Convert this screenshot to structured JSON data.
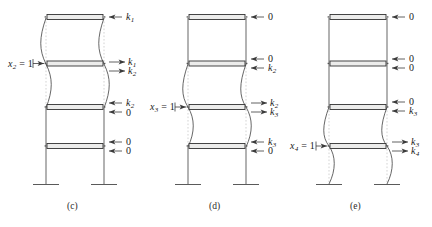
{
  "figure": {
    "title": "",
    "background": "#ffffff",
    "ink": "#3a3a3a",
    "beam_fill": "#e8e8e6",
    "dash_color": "#b9b9b9"
  },
  "panels": [
    {
      "id": "c",
      "caption": "(c)",
      "dof_label": "x",
      "dof_sub": "2",
      "dof_eq": " = 1",
      "dof_text": "x2 = 1",
      "deflected_between_floors": [
        1,
        3
      ],
      "floors": [
        {
          "index": 1,
          "labels": [
            "k1"
          ]
        },
        {
          "index": 2,
          "labels": [
            "k1",
            "k2"
          ]
        },
        {
          "index": 3,
          "labels": [
            "k2",
            "0"
          ]
        },
        {
          "index": 4,
          "labels": [
            "0",
            "0"
          ]
        }
      ],
      "force_labels": [
        {
          "base": "k",
          "sub": "1",
          "dir": "left",
          "floor": 1,
          "slot": 0
        },
        {
          "base": "k",
          "sub": "1",
          "dir": "right",
          "floor": 2,
          "slot": 0
        },
        {
          "base": "k",
          "sub": "2",
          "dir": "right",
          "floor": 2,
          "slot": 1
        },
        {
          "base": "k",
          "sub": "2",
          "dir": "left",
          "floor": 3,
          "slot": 0
        },
        {
          "base": "0",
          "sub": "",
          "dir": "left",
          "floor": 3,
          "slot": 1
        },
        {
          "base": "0",
          "sub": "",
          "dir": "left",
          "floor": 4,
          "slot": 0
        },
        {
          "base": "0",
          "sub": "",
          "dir": "left",
          "floor": 4,
          "slot": 1
        }
      ]
    },
    {
      "id": "d",
      "caption": "(d)",
      "dof_label": "x",
      "dof_sub": "3",
      "dof_eq": " = 1",
      "dof_text": "x3 = 1",
      "deflected_between_floors": [
        2,
        4
      ],
      "floors": [
        {
          "index": 1,
          "labels": [
            "0"
          ]
        },
        {
          "index": 2,
          "labels": [
            "0",
            "k2"
          ]
        },
        {
          "index": 3,
          "labels": [
            "k2",
            "k3"
          ]
        },
        {
          "index": 4,
          "labels": [
            "k3",
            "0"
          ]
        }
      ],
      "force_labels": [
        {
          "base": "0",
          "sub": "",
          "dir": "left",
          "floor": 1,
          "slot": 0
        },
        {
          "base": "0",
          "sub": "",
          "dir": "left",
          "floor": 2,
          "slot": 0
        },
        {
          "base": "k",
          "sub": "2",
          "dir": "left",
          "floor": 2,
          "slot": 1
        },
        {
          "base": "k",
          "sub": "2",
          "dir": "right",
          "floor": 3,
          "slot": 0
        },
        {
          "base": "k",
          "sub": "3",
          "dir": "right",
          "floor": 3,
          "slot": 1
        },
        {
          "base": "k",
          "sub": "3",
          "dir": "left",
          "floor": 4,
          "slot": 0
        },
        {
          "base": "0",
          "sub": "",
          "dir": "left",
          "floor": 4,
          "slot": 1
        }
      ]
    },
    {
      "id": "e",
      "caption": "(e)",
      "dof_label": "x",
      "dof_sub": "4",
      "dof_eq": " = 1",
      "dof_text": "x4 = 1",
      "deflected_between_floors": [
        3,
        5
      ],
      "floors": [
        {
          "index": 1,
          "labels": [
            "0"
          ]
        },
        {
          "index": 2,
          "labels": [
            "0",
            "0"
          ]
        },
        {
          "index": 3,
          "labels": [
            "0",
            "k3"
          ]
        },
        {
          "index": 4,
          "labels": [
            "k3",
            "k4"
          ]
        }
      ],
      "force_labels": [
        {
          "base": "0",
          "sub": "",
          "dir": "left",
          "floor": 1,
          "slot": 0
        },
        {
          "base": "0",
          "sub": "",
          "dir": "left",
          "floor": 2,
          "slot": 0
        },
        {
          "base": "0",
          "sub": "",
          "dir": "left",
          "floor": 2,
          "slot": 1
        },
        {
          "base": "0",
          "sub": "",
          "dir": "left",
          "floor": 3,
          "slot": 0
        },
        {
          "base": "k",
          "sub": "3",
          "dir": "left",
          "floor": 3,
          "slot": 1
        },
        {
          "base": "k",
          "sub": "3",
          "dir": "right",
          "floor": 4,
          "slot": 0
        },
        {
          "base": "k",
          "sub": "4",
          "dir": "right",
          "floor": 4,
          "slot": 1
        }
      ]
    }
  ],
  "captions": {
    "c": "(c)",
    "d": "(d)",
    "e": "(e)"
  }
}
